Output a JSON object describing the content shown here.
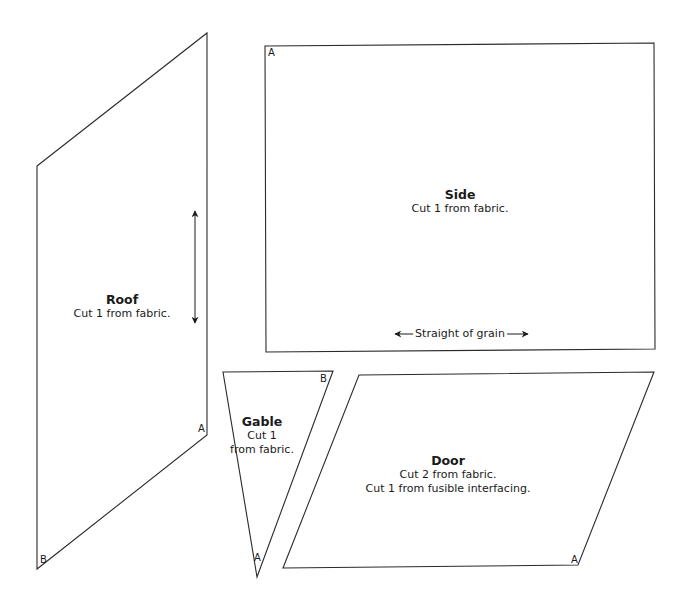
{
  "pieces": {
    "roof": {
      "title": "Roof",
      "instructions": [
        "Cut 1 from fabric."
      ],
      "corner_labels": [
        "A",
        "B"
      ],
      "grain_arrow": "vertical"
    },
    "side": {
      "title": "Side",
      "instructions": [
        "Cut 1 from fabric."
      ],
      "corner_labels": [
        "A"
      ],
      "grain_label": "Straight of grain"
    },
    "gable": {
      "title": "Gable",
      "instructions": [
        "Cut 1",
        "from fabric."
      ],
      "corner_labels": [
        "B",
        "A"
      ]
    },
    "door": {
      "title": "Door",
      "instructions": [
        "Cut 2 from fabric.",
        "Cut 1 from fusible interfacing."
      ],
      "corner_labels": [
        "A"
      ]
    }
  },
  "colors": {
    "outline": "#2b2b2b",
    "text": "#1a1a1a",
    "background": "#ffffff"
  }
}
